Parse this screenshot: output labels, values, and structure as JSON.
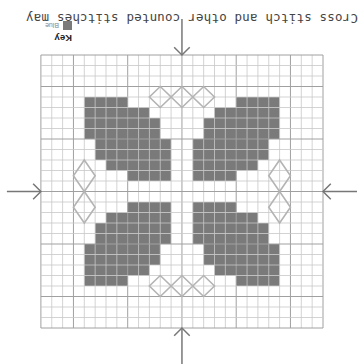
{
  "caption": "Cross stitch and other counted stitches may",
  "key": {
    "title": "Key",
    "items": [
      {
        "label": "Blue",
        "color": "#7a7a7a"
      }
    ]
  },
  "grid": {
    "cols": 26,
    "rows": 26,
    "major_every": 5,
    "major_offset": 3,
    "center": 13,
    "line_color": "#c8c8c8",
    "major_line_color": "#a0a0a0",
    "fill_color": "#7a7a7a",
    "outline_color": "#b4b4b4"
  },
  "pattern": {
    "leaf_top_left_rows": [
      {
        "row": 4,
        "from": 4,
        "to": 7
      },
      {
        "row": 5,
        "from": 4,
        "to": 9
      },
      {
        "row": 6,
        "from": 4,
        "to": 10
      },
      {
        "row": 7,
        "from": 4,
        "to": 10
      },
      {
        "row": 8,
        "from": 5,
        "to": 11
      },
      {
        "row": 9,
        "from": 5,
        "to": 11
      },
      {
        "row": 10,
        "from": 6,
        "to": 11
      },
      {
        "row": 11,
        "from": 8,
        "to": 11
      }
    ],
    "diamonds_top": [
      {
        "col": 10,
        "row": 3,
        "w": 2,
        "h": 2
      },
      {
        "col": 12,
        "row": 3,
        "w": 2,
        "h": 2
      },
      {
        "col": 14,
        "row": 3,
        "w": 2,
        "h": 2
      }
    ],
    "diamonds_side": [
      {
        "col": 3,
        "row": 10,
        "w": 2,
        "h": 3
      },
      {
        "col": 3,
        "row": 13,
        "w": 2,
        "h": 3
      }
    ]
  },
  "arrows": [
    "top",
    "bottom",
    "left",
    "right"
  ]
}
